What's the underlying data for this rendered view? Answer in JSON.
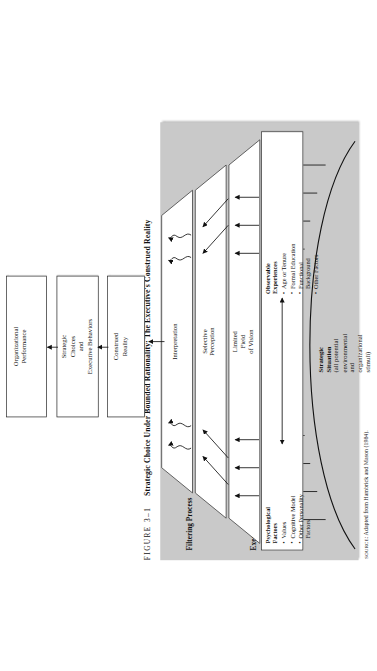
{
  "figure": {
    "number_label": "FIGURE 3–1",
    "title": "Strategic Choice Under Bounded Rationality: The Executive's Construed Reality",
    "source_prefix": "SOURCE",
    "source_text": ": Adapted from Hambrick and Mason (1984)."
  },
  "headings": {
    "executive_orientation": "Executive Orientation",
    "filtering_process": "Filtering Process"
  },
  "strategic_situation": {
    "title_line1": "Strategic",
    "title_line2": "Situation",
    "detail_line1": "(all potential",
    "detail_line2": "environmental",
    "detail_line3": "and",
    "detail_line4": "organizational",
    "detail_line5": "stimuli)"
  },
  "executive_orientation_box": {
    "left_column": {
      "heading_line1": "Psychological",
      "heading_line2": "Factors",
      "items": [
        "Values",
        "Cognitive Model",
        "Other Personality",
        "Factors"
      ]
    },
    "right_column": {
      "heading_line1": "Observable",
      "heading_line2": "Experiences",
      "items": [
        "Age or Tenure",
        "Formal Education",
        "Functional",
        "Background",
        "Other Factors"
      ]
    }
  },
  "funnels": [
    {
      "label_line1": "Limited",
      "label_line2": "Field",
      "label_line3": "of Vision"
    },
    {
      "label_line1": "Selective",
      "label_line2": "Perception",
      "label_line3": ""
    },
    {
      "label_line1": "Interpretation",
      "label_line2": "",
      "label_line3": ""
    }
  ],
  "outcome_boxes": [
    {
      "line1": "Construed",
      "line2": "Reality",
      "line3": "",
      "line4": ""
    },
    {
      "line1": "Strategic",
      "line2": "Choices",
      "line3": "and",
      "line4": "Executive Behaviors"
    },
    {
      "line1": "Organizational",
      "line2": "Performance",
      "line3": "",
      "line4": ""
    }
  ],
  "colors": {
    "panel_gray": "#c9c9c9",
    "box_white": "#ffffff",
    "ink": "#1a1a1a",
    "page_white": "#ffffff"
  }
}
